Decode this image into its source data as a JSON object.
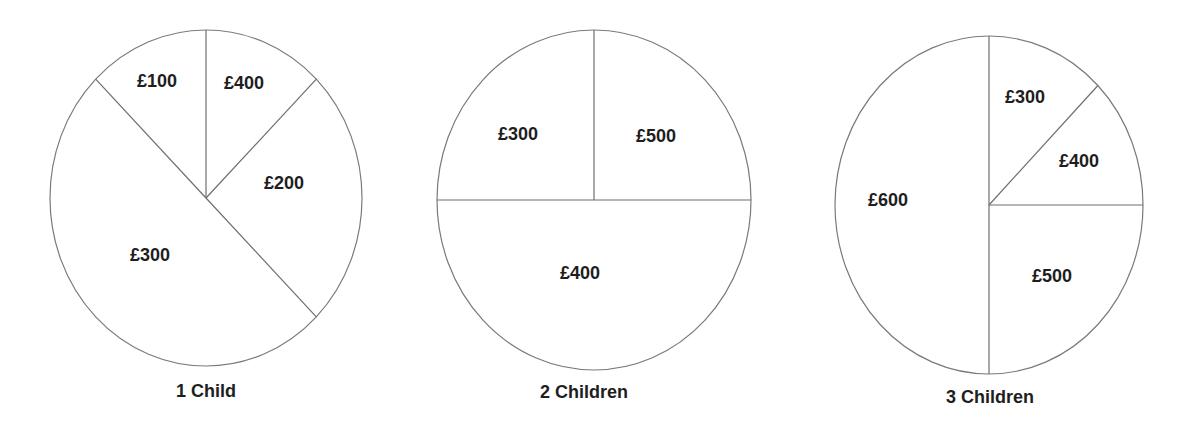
{
  "colors": {
    "background": "#ffffff",
    "stroke": "#6e6e6e",
    "text": "#1e1e1e"
  },
  "chart_data": [
    {
      "type": "pie",
      "title": "1 Child",
      "labels": [
        "£100",
        "£400",
        "£200",
        "£300"
      ],
      "values": [
        100,
        400,
        200,
        300
      ],
      "currency": "GBP",
      "note": "slices drawn as divider lines; angles not proportional to values",
      "geometry": {
        "cx": 206,
        "cy": 198,
        "rx": 156,
        "ry": 168,
        "dividers_deg_from_top_clockwise": [
          0,
          45,
          135,
          315
        ]
      },
      "label_positions": [
        [
          157,
          82
        ],
        [
          244,
          84
        ],
        [
          284,
          184
        ],
        [
          150,
          256
        ]
      ],
      "title_position": [
        206,
        392
      ]
    },
    {
      "type": "pie",
      "title": "2 Children",
      "labels": [
        "£300",
        "£500",
        "£400"
      ],
      "values": [
        300,
        500,
        400
      ],
      "currency": "GBP",
      "note": "slices drawn as divider lines; angles not proportional to values",
      "geometry": {
        "cx": 594,
        "cy": 200,
        "rx": 157,
        "ry": 170,
        "dividers_deg_from_top_clockwise": [
          0,
          90,
          270
        ]
      },
      "label_positions": [
        [
          518,
          135
        ],
        [
          656,
          137
        ],
        [
          580,
          274
        ]
      ],
      "title_position": [
        584,
        393
      ]
    },
    {
      "type": "pie",
      "title": "3 Children",
      "labels": [
        "£300",
        "£400",
        "£500",
        "£600"
      ],
      "values": [
        300,
        400,
        500,
        600
      ],
      "currency": "GBP",
      "note": "slices drawn as divider lines; angles not proportional to values",
      "geometry": {
        "cx": 989,
        "cy": 205,
        "rx": 154,
        "ry": 169,
        "dividers_deg_from_top_clockwise": [
          0,
          45,
          90,
          180
        ]
      },
      "label_positions": [
        [
          1025,
          98
        ],
        [
          1079,
          162
        ],
        [
          1052,
          277
        ],
        [
          888,
          201
        ]
      ],
      "title_position": [
        990,
        398
      ]
    }
  ]
}
